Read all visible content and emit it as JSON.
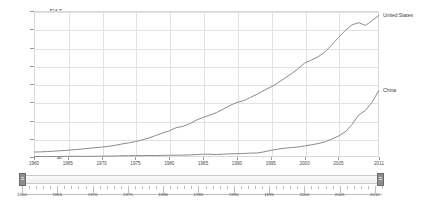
{
  "chart_data": {
    "type": "line",
    "title": "",
    "xlabel": "",
    "ylabel": "",
    "xlim": [
      1960,
      2011
    ],
    "ylim": [
      0,
      16
    ],
    "grid": true,
    "legend_position": "right-inline",
    "y_tick_labels": [
      "$16 T",
      "$14 T",
      "$12 T",
      "$10 T",
      "$8 T",
      "$6 T",
      "$4 T",
      "$2 T",
      "$0"
    ],
    "y_tick_values": [
      16,
      14,
      12,
      10,
      8,
      6,
      4,
      2,
      0
    ],
    "x_tick_labels": [
      "1960",
      "1965",
      "1970",
      "1975",
      "1980",
      "1985",
      "1990",
      "1995",
      "2000",
      "2005",
      "2011"
    ],
    "x_tick_values": [
      1960,
      1965,
      1970,
      1975,
      1980,
      1985,
      1990,
      1995,
      2000,
      2005,
      2011
    ],
    "x": [
      1960,
      1961,
      1962,
      1963,
      1964,
      1965,
      1966,
      1967,
      1968,
      1969,
      1970,
      1971,
      1972,
      1973,
      1974,
      1975,
      1976,
      1977,
      1978,
      1979,
      1980,
      1981,
      1982,
      1983,
      1984,
      1985,
      1986,
      1987,
      1988,
      1989,
      1990,
      1991,
      1992,
      1993,
      1994,
      1995,
      1996,
      1997,
      1998,
      1999,
      2000,
      2001,
      2002,
      2003,
      2004,
      2005,
      2006,
      2007,
      2008,
      2009,
      2010,
      2011
    ],
    "series": [
      {
        "name": "United States",
        "color": "#8a8a8a",
        "label_position": "end",
        "values": [
          0.54,
          0.56,
          0.6,
          0.64,
          0.69,
          0.74,
          0.81,
          0.86,
          0.94,
          1.02,
          1.08,
          1.17,
          1.28,
          1.43,
          1.55,
          1.69,
          1.88,
          2.09,
          2.36,
          2.63,
          2.86,
          3.21,
          3.35,
          3.64,
          4.04,
          4.35,
          4.59,
          4.87,
          5.25,
          5.66,
          5.98,
          6.17,
          6.54,
          6.88,
          7.31,
          7.66,
          8.1,
          8.61,
          9.09,
          9.66,
          10.29,
          10.62,
          10.98,
          11.51,
          12.27,
          13.09,
          13.86,
          14.48,
          14.72,
          14.42,
          14.96,
          15.53
        ]
      },
      {
        "name": "China",
        "color": "#8a8a8a",
        "label_position": "end",
        "values": [
          0.06,
          0.05,
          0.05,
          0.05,
          0.06,
          0.07,
          0.08,
          0.07,
          0.07,
          0.08,
          0.09,
          0.1,
          0.11,
          0.14,
          0.14,
          0.16,
          0.15,
          0.17,
          0.15,
          0.18,
          0.19,
          0.2,
          0.21,
          0.23,
          0.26,
          0.31,
          0.3,
          0.27,
          0.31,
          0.35,
          0.36,
          0.38,
          0.43,
          0.44,
          0.56,
          0.73,
          0.86,
          0.96,
          1.03,
          1.09,
          1.21,
          1.34,
          1.47,
          1.66,
          1.96,
          2.29,
          2.75,
          3.55,
          4.6,
          5.11,
          6.04,
          7.32
        ]
      }
    ]
  },
  "range_slider": {
    "name": "year-range-slider",
    "min_label": "1960",
    "max_label": "2010",
    "start_value": "1960",
    "end_value": "2011",
    "tick_labels": [
      "1960",
      "1965",
      "1970",
      "1975",
      "1980",
      "1985",
      "1990",
      "1995",
      "2000",
      "2005",
      "2010"
    ],
    "tick_values": [
      1960,
      1965,
      1970,
      1975,
      1980,
      1985,
      1990,
      1995,
      2000,
      2005,
      2010
    ],
    "left_handle_label": "left-handle",
    "right_handle_label": "right-handle"
  },
  "colors": {
    "line": "#8a8a8a",
    "grid": "#e2e2e2",
    "plot_border": "#d8d8d8",
    "tick_text": "#4a4a4a",
    "handle": "#8d8d8d",
    "background": "#ffffff"
  }
}
